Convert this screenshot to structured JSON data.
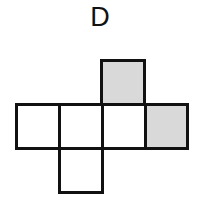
{
  "figure": {
    "label": "D",
    "colors": {
      "stroke": "#111111",
      "shaded": "#d9d9d9",
      "empty": "#ffffff"
    },
    "cells": [
      {
        "id": "top",
        "x": 100,
        "y": 59,
        "w": 46,
        "h": 47,
        "shaded": true
      },
      {
        "id": "row-1",
        "x": 15,
        "y": 103,
        "w": 46,
        "h": 47,
        "shaded": false
      },
      {
        "id": "row-2",
        "x": 58,
        "y": 103,
        "w": 46,
        "h": 47,
        "shaded": false
      },
      {
        "id": "row-3",
        "x": 101,
        "y": 103,
        "w": 46,
        "h": 47,
        "shaded": false
      },
      {
        "id": "row-4",
        "x": 144,
        "y": 103,
        "w": 45,
        "h": 47,
        "shaded": true
      },
      {
        "id": "bottom",
        "x": 58,
        "y": 147,
        "w": 46,
        "h": 47,
        "shaded": false
      }
    ]
  }
}
